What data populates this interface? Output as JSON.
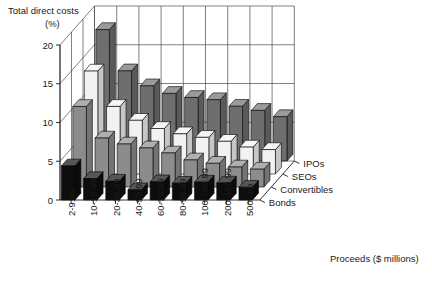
{
  "chart_data": {
    "type": "bar",
    "render": "3d-grouped-bar",
    "title_line1": "Total direct costs",
    "title_line2": "(%)",
    "ylabel": "Total direct costs (%)",
    "xlabel": "Proceeds ($ millions)",
    "zlabel": "",
    "ylim": [
      0,
      20
    ],
    "yticks": [
      0,
      5,
      10,
      15,
      20
    ],
    "ytick_labels": [
      "0",
      "5",
      "10",
      "15",
      "20"
    ],
    "grid": true,
    "legend_position": "right-inline-axis",
    "categories": [
      "2-9.99",
      "10-19.99",
      "20-39.99",
      "40-59.99",
      "60-79.99",
      "80-99.99",
      "100-199.99",
      "200-499.99",
      "500- up"
    ],
    "series": [
      {
        "name": "IPOs",
        "color": "#6e6e6e",
        "values": [
          16.96,
          11.63,
          9.7,
          8.72,
          8.2,
          7.91,
          7.06,
          6.53,
          5.72
        ]
      },
      {
        "name": "SEOs",
        "color": "#f2f2f2",
        "values": [
          13.28,
          8.72,
          6.93,
          5.87,
          5.18,
          4.73,
          4.22,
          3.47,
          3.15
        ]
      },
      {
        "name": "Convertibles",
        "color": "#8c8c8c",
        "values": [
          10.39,
          6.32,
          5.55,
          5.04,
          4.39,
          3.49,
          3.06,
          2.58,
          2.3
        ]
      },
      {
        "name": "Bonds",
        "color": "#0d0d0d",
        "values": [
          4.39,
          2.76,
          2.42,
          1.32,
          2.34,
          2.16,
          2.31,
          2.19,
          1.64
        ]
      }
    ]
  }
}
